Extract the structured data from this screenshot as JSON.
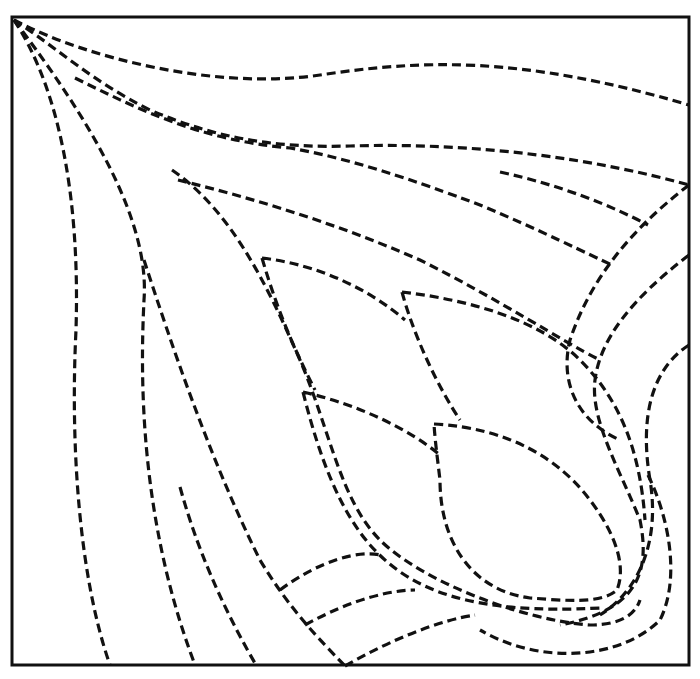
{
  "pattern": {
    "name": "corner-tulip-quilting-pattern",
    "frame": {
      "x": 11,
      "y": 16,
      "width": 679,
      "height": 650
    },
    "stroke_color": "#111111",
    "background": "#ffffff",
    "lines": [
      {
        "id": "top-arc-1",
        "d": "M14,20 C90,60 220,90 320,75 C420,60 520,55 689,105"
      },
      {
        "id": "top-arc-2",
        "d": "M14,20 C60,50 90,80 150,110 C220,140 280,148 350,146 C480,142 600,160 689,185"
      },
      {
        "id": "top-arc-3",
        "d": "M75,78 C140,110 200,140 290,148 C360,160 440,190 480,205 C540,230 590,255 612,265"
      },
      {
        "id": "top-arc-4",
        "d": "M500,172 C560,185 610,205 648,225"
      },
      {
        "id": "left-curve-1",
        "d": "M14,20 C60,90 80,200 76,330 C70,450 80,580 110,665"
      },
      {
        "id": "left-curve-2",
        "d": "M14,20 C90,120 150,220 144,300 C140,380 140,520 195,665"
      },
      {
        "id": "left-curve-3",
        "d": "M144,260 C170,340 210,460 260,560 C290,610 320,640 345,666"
      },
      {
        "id": "left-short",
        "d": "M180,487 C200,560 230,620 256,665"
      },
      {
        "id": "inner-curve-1",
        "d": "M172,170 C230,210 265,280 300,360 C330,430 340,500 380,540 C420,580 520,620 590,625 C620,625 635,615 640,600"
      },
      {
        "id": "inner-top",
        "d": "M178,180 C260,200 340,225 420,260 C500,300 560,340 600,360"
      },
      {
        "id": "leaf-1",
        "d": "M262,258 C320,265 370,290 405,320 M262,258 C280,320 300,360 315,390"
      },
      {
        "id": "leaf-2",
        "d": "M402,292 C470,300 540,320 580,360 C620,400 640,450 645,520 M402,292 C415,340 440,390 460,420"
      },
      {
        "id": "leaf-3",
        "d": "M303,392 C360,405 410,430 440,455 M303,392 C320,460 340,510 370,545 C410,590 470,615 600,608"
      },
      {
        "id": "leaf-4",
        "d": "M434,424 C510,428 560,460 590,500 C620,540 625,570 617,590 C600,605 560,600 530,598 C470,590 440,540 440,480 C437,455 435,440 434,424"
      },
      {
        "id": "right-arc-1",
        "d": "M689,185 C630,230 590,280 570,340 C560,380 575,420 620,440"
      },
      {
        "id": "right-arc-2",
        "d": "M689,255 C630,300 600,340 595,380 C590,420 620,470 640,520 C650,570 640,610 560,625"
      },
      {
        "id": "right-arc-3",
        "d": "M689,345 C650,370 640,420 650,480 C660,540 640,590 600,615"
      },
      {
        "id": "right-tail",
        "d": "M648,475 C670,520 680,580 660,620 C620,660 540,665 480,630"
      },
      {
        "id": "bottom-arc-1",
        "d": "M280,590 C320,560 360,550 380,555"
      },
      {
        "id": "bottom-arc-2",
        "d": "M305,625 C350,600 390,590 415,590"
      },
      {
        "id": "bottom-arc-3",
        "d": "M345,666 C390,640 440,620 475,615"
      }
    ]
  }
}
